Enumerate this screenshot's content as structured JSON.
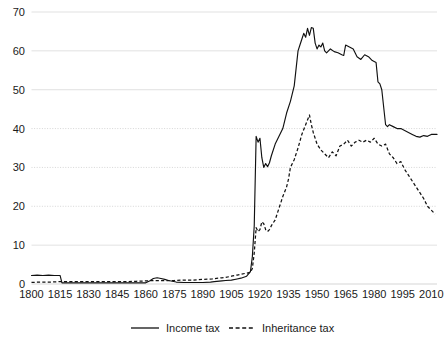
{
  "chart_data": {
    "type": "line",
    "title": "",
    "subtitle": "",
    "xlabel": "",
    "ylabel": "",
    "xlim": [
      1800,
      2013
    ],
    "ylim": [
      0,
      70
    ],
    "grid": true,
    "legend_position": "bottom",
    "y_ticks": [
      0,
      10,
      20,
      30,
      40,
      50,
      60,
      70
    ],
    "y_tick_labels": [
      "0",
      "10",
      "20",
      "30",
      "40",
      "50",
      "60",
      "70"
    ],
    "x_ticks": [
      1800,
      1815,
      1830,
      1845,
      1860,
      1875,
      1890,
      1905,
      1920,
      1935,
      1950,
      1965,
      1980,
      1995,
      2010
    ],
    "x_tick_labels": [
      "1800",
      "1815",
      "1830",
      "1845",
      "1860",
      "1875",
      "1890",
      "1905",
      "1920",
      "1935",
      "1950",
      "1965",
      "1980",
      "1995",
      "2010"
    ],
    "legend": [
      {
        "name": "Income tax",
        "style": "solid"
      },
      {
        "name": "Inheritance tax",
        "style": "dashed"
      }
    ],
    "series": [
      {
        "name": "Income tax",
        "style": "solid",
        "x": [
          1800,
          1803,
          1806,
          1809,
          1812,
          1815,
          1816,
          1820,
          1825,
          1830,
          1835,
          1840,
          1845,
          1850,
          1855,
          1860,
          1862,
          1864,
          1866,
          1868,
          1870,
          1872,
          1874,
          1876,
          1880,
          1885,
          1890,
          1894,
          1896,
          1900,
          1902,
          1905,
          1908,
          1910,
          1913,
          1915,
          1916,
          1917,
          1918,
          1919,
          1920,
          1921,
          1922,
          1923,
          1924,
          1925,
          1926,
          1928,
          1930,
          1932,
          1934,
          1936,
          1938,
          1940,
          1941,
          1942,
          1943,
          1944,
          1945,
          1946,
          1947,
          1948,
          1949,
          1950,
          1951,
          1952,
          1953,
          1954,
          1955,
          1957,
          1959,
          1961,
          1963,
          1964,
          1965,
          1967,
          1969,
          1971,
          1973,
          1975,
          1977,
          1979,
          1981,
          1982,
          1983,
          1984,
          1986,
          1987,
          1988,
          1990,
          1992,
          1994,
          1996,
          1998,
          2000,
          2002,
          2004,
          2006,
          2008,
          2010,
          2012,
          2013
        ],
        "y": [
          2.2,
          2.3,
          2.2,
          2.3,
          2.2,
          2.2,
          0.3,
          0.3,
          0.3,
          0.3,
          0.3,
          0.3,
          0.3,
          0.3,
          0.3,
          0.3,
          0.8,
          1.4,
          1.6,
          1.4,
          1.2,
          0.9,
          0.7,
          0.5,
          0.4,
          0.4,
          0.4,
          0.5,
          0.6,
          0.8,
          0.9,
          1.0,
          1.3,
          1.5,
          2.0,
          3.2,
          7.0,
          15.0,
          38.0,
          36.5,
          37.5,
          32.5,
          30.0,
          31.0,
          30.2,
          31.2,
          33.0,
          36.0,
          38.0,
          40.0,
          44.0,
          47.0,
          51.0,
          60.0,
          61.5,
          63.0,
          64.5,
          63.5,
          65.8,
          64.0,
          66.0,
          65.8,
          62.0,
          60.5,
          61.5,
          61.0,
          62.0,
          60.0,
          59.5,
          60.5,
          59.8,
          59.5,
          59.0,
          58.8,
          61.5,
          61.0,
          60.5,
          58.5,
          57.8,
          59.0,
          58.5,
          57.5,
          57.0,
          52.0,
          51.5,
          50.0,
          41.0,
          40.5,
          41.0,
          40.5,
          40.0,
          40.0,
          39.5,
          39.0,
          38.5,
          38.0,
          37.8,
          38.2,
          38.0,
          38.5,
          38.5,
          38.5
        ]
      },
      {
        "name": "Inheritance tax",
        "style": "dashed",
        "x": [
          1800,
          1805,
          1810,
          1815,
          1820,
          1825,
          1830,
          1835,
          1840,
          1845,
          1850,
          1855,
          1860,
          1865,
          1870,
          1875,
          1880,
          1885,
          1890,
          1895,
          1898,
          1900,
          1902,
          1905,
          1908,
          1910,
          1913,
          1915,
          1916,
          1917,
          1918,
          1919,
          1920,
          1921,
          1922,
          1923,
          1924,
          1925,
          1926,
          1928,
          1930,
          1932,
          1934,
          1935,
          1936,
          1938,
          1940,
          1942,
          1944,
          1946,
          1947,
          1948,
          1950,
          1952,
          1954,
          1956,
          1958,
          1960,
          1962,
          1964,
          1966,
          1968,
          1970,
          1972,
          1974,
          1976,
          1978,
          1980,
          1982,
          1984,
          1986,
          1988,
          1990,
          1992,
          1994,
          1996,
          1998,
          2000,
          2002,
          2004,
          2006,
          2008,
          2010,
          2012
        ],
        "y": [
          0.4,
          0.5,
          0.5,
          0.6,
          0.6,
          0.6,
          0.6,
          0.6,
          0.6,
          0.6,
          0.6,
          0.7,
          0.8,
          0.9,
          0.9,
          0.9,
          1.0,
          1.0,
          1.2,
          1.3,
          1.5,
          1.6,
          1.7,
          2.0,
          2.3,
          2.5,
          2.8,
          3.0,
          4.0,
          8.0,
          14.5,
          13.5,
          14.0,
          16.0,
          15.5,
          14.0,
          13.5,
          14.0,
          15.0,
          16.5,
          19.5,
          22.5,
          25.0,
          27.0,
          30.0,
          32.0,
          35.0,
          38.5,
          41.0,
          43.5,
          41.0,
          39.0,
          36.0,
          34.5,
          33.5,
          32.5,
          34.0,
          33.0,
          35.5,
          36.0,
          37.0,
          35.5,
          36.5,
          37.0,
          36.5,
          37.0,
          36.5,
          37.5,
          36.0,
          35.5,
          36.0,
          33.5,
          32.5,
          31.0,
          31.5,
          29.5,
          28.0,
          26.5,
          25.0,
          23.5,
          22.0,
          20.0,
          19.0,
          18.0
        ]
      }
    ]
  }
}
